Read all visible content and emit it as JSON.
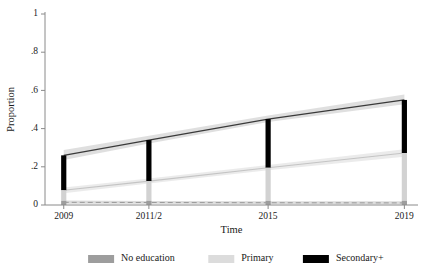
{
  "chart_data": {
    "type": "line",
    "title": "",
    "xlabel": "Time",
    "ylabel": "Proportion",
    "x": [
      2009,
      2011.5,
      2015,
      2019
    ],
    "categories": [
      "2009",
      "2011/2",
      "2015",
      "2019"
    ],
    "xticklabels": [
      "2009",
      "2011/2",
      "2015",
      "2019"
    ],
    "yticklabels": [
      "0",
      ".2",
      ".4",
      ".6",
      ".8",
      "1"
    ],
    "ytickvalues": [
      0,
      0.2,
      0.4,
      0.6,
      0.8,
      1
    ],
    "ylim": [
      0,
      1
    ],
    "xlim": [
      2008.45,
      2019.4
    ],
    "grid": false,
    "legend_position": "bottom",
    "series": [
      {
        "name": "No education",
        "color": "#808080",
        "line_color": "#3a3a3a",
        "band_color": "#d9d9d9",
        "values": [
          0.26,
          0.34,
          0.45,
          0.55
        ],
        "ci_lower": [
          0.235,
          0.322,
          0.434,
          0.527
        ],
        "ci_upper": [
          0.288,
          0.362,
          0.468,
          0.578
        ]
      },
      {
        "name": "Primary",
        "color": "#d2d2d2",
        "line_color": "#c4c4c4",
        "band_color": "#e8e8e8",
        "values": [
          0.077,
          0.125,
          0.195,
          0.272
        ],
        "ci_lower": [
          0.062,
          0.112,
          0.182,
          0.252
        ],
        "ci_upper": [
          0.092,
          0.139,
          0.21,
          0.292
        ]
      },
      {
        "name": "Secondary+",
        "color": "#000000",
        "line_color": "#9a9a9a",
        "band_color": "#bdbdbd",
        "values": [
          0.014,
          0.013,
          0.012,
          0.011
        ],
        "ci_lower": [
          0.006,
          0.006,
          0.005,
          0.004
        ],
        "ci_upper": [
          0.023,
          0.021,
          0.02,
          0.019
        ]
      }
    ],
    "markers": [
      {
        "x": "2009",
        "segments": [
          {
            "name": "Secondary+",
            "from": 0.077,
            "to": 0.26,
            "color": "#000000"
          },
          {
            "name": "Primary",
            "from": 0.022,
            "to": 0.077,
            "color": "#d2d2d2"
          },
          {
            "name": "No education",
            "from": 0.0,
            "to": 0.022,
            "color": "#9d9d9d"
          }
        ]
      },
      {
        "x": "2011/2",
        "segments": [
          {
            "name": "Secondary+",
            "from": 0.125,
            "to": 0.34,
            "color": "#000000"
          },
          {
            "name": "Primary",
            "from": 0.022,
            "to": 0.125,
            "color": "#d2d2d2"
          },
          {
            "name": "No education",
            "from": 0.0,
            "to": 0.022,
            "color": "#9d9d9d"
          }
        ]
      },
      {
        "x": "2015",
        "segments": [
          {
            "name": "Secondary+",
            "from": 0.195,
            "to": 0.45,
            "color": "#000000"
          },
          {
            "name": "Primary",
            "from": 0.022,
            "to": 0.195,
            "color": "#d2d2d2"
          },
          {
            "name": "No education",
            "from": 0.0,
            "to": 0.022,
            "color": "#9d9d9d"
          }
        ]
      },
      {
        "x": "2019",
        "segments": [
          {
            "name": "Secondary+",
            "from": 0.272,
            "to": 0.55,
            "color": "#000000"
          },
          {
            "name": "Primary",
            "from": 0.022,
            "to": 0.272,
            "color": "#d2d2d2"
          },
          {
            "name": "No education",
            "from": 0.0,
            "to": 0.022,
            "color": "#9d9d9d"
          }
        ]
      }
    ],
    "legend": [
      {
        "label": "No education",
        "color": "#9d9d9d"
      },
      {
        "label": "Primary",
        "color": "#dcdcdc"
      },
      {
        "label": "Secondary+",
        "color": "#000000"
      }
    ]
  }
}
